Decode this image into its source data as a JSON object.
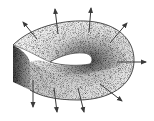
{
  "figure": {
    "width": 154,
    "height": 121,
    "background": "#ffffff",
    "ink_color": "#3a3a3a"
  },
  "surface": {
    "outer_edge_path": "M13,45 C30,28 60,20 85,21 C115,22 135,38 134,62 C133,85 110,100 78,100 C55,100 40,96 30,90",
    "top_face_path": "M13,45 C30,28 60,20 85,21 C115,22 135,38 134,62 C133,85 110,100 78,100 C55,100 40,96 30,90 L30,62 C38,58 46,62 52,64 C62,66 80,66 90,64 C94,60 92,54 84,53 C72,52 60,56 50,62 C40,58 28,50 13,45 Z",
    "side_band_path": "M13,45 C22,50 28,55 30,62 L30,90 C24,87 18,84 13,82 Z",
    "hole_path": "M50,62 C60,56 72,52 84,53 C92,54 94,60 90,64 C80,66 62,66 50,62 Z",
    "shade_center": [
      95,
      60
    ],
    "surface_light": "#f2f2f2",
    "surface_dark": "#4a4a4a",
    "band_light": "#bdbdbd",
    "band_dark": "#3c3c3c"
  },
  "normal_vectors": [
    {
      "id": "upper-left",
      "x1": 37,
      "y1": 39,
      "x2": 23,
      "y2": 22
    },
    {
      "id": "top-left",
      "x1": 58,
      "y1": 34,
      "x2": 55,
      "y2": 9
    },
    {
      "id": "top-right",
      "x1": 89,
      "y1": 32,
      "x2": 91,
      "y2": 8
    },
    {
      "id": "upper-right",
      "x1": 110,
      "y1": 43,
      "x2": 127,
      "y2": 23
    },
    {
      "id": "right",
      "x1": 117,
      "y1": 62,
      "x2": 146,
      "y2": 62
    },
    {
      "id": "lower-right",
      "x1": 100,
      "y1": 84,
      "x2": 122,
      "y2": 101
    },
    {
      "id": "bottom-right",
      "x1": 78,
      "y1": 88,
      "x2": 84,
      "y2": 112
    },
    {
      "id": "bottom-middle",
      "x1": 54,
      "y1": 88,
      "x2": 57,
      "y2": 112
    },
    {
      "id": "bottom-left",
      "x1": 33,
      "y1": 80,
      "x2": 33,
      "y2": 107
    }
  ]
}
